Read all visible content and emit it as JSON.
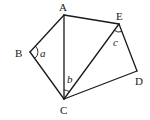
{
  "diagram": {
    "type": "geometry-figure",
    "vertices": {
      "A": {
        "label": "A",
        "x": 64,
        "y": 15
      },
      "B": {
        "label": "B",
        "x": 30,
        "y": 52
      },
      "C": {
        "label": "C",
        "x": 64,
        "y": 99
      },
      "D": {
        "label": "D",
        "x": 137,
        "y": 71
      },
      "E": {
        "label": "E",
        "x": 119,
        "y": 24
      }
    },
    "segments": [
      "AB",
      "BC",
      "AC",
      "AE",
      "CE",
      "ED",
      "CD"
    ],
    "angles": {
      "a": {
        "label": "a",
        "vertex": "B"
      },
      "b": {
        "label": "b",
        "vertex": "C",
        "between": "CA-CE"
      },
      "c": {
        "label": "c",
        "vertex": "E",
        "between": "EC-ED"
      }
    }
  }
}
